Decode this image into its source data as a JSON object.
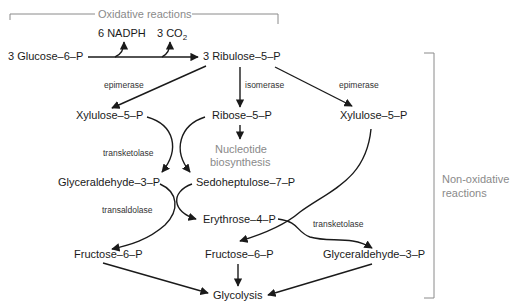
{
  "sections": {
    "oxidative": "Oxidative reactions",
    "non_oxidative_line1": "Non-oxidative",
    "non_oxidative_line2": "reactions"
  },
  "nodes": {
    "glucose6p": "3 Glucose–6–P",
    "nadph": "6 NADPH",
    "co2": "3 CO",
    "co2_sub": "2",
    "ribulose5p": "3 Ribulose–5–P",
    "xylulose5p_left": "Xylulose–5–P",
    "ribose5p": "Ribose–5–P",
    "xylulose5p_right": "Xylulose–5–P",
    "nucleotide_line1": "Nucleotide",
    "nucleotide_line2": "biosynthesis",
    "glyceraldehyde3p_left": "Glyceraldehyde–3–P",
    "sedoheptulose7p": "Sedoheptulose–7–P",
    "erythrose4p": "Erythrose–4–P",
    "fructose6p_left": "Fructose–6–P",
    "fructose6p_mid": "Fructose–6–P",
    "glyceraldehyde3p_right": "Glyceraldehyde–3–P",
    "glycolysis": "Glycolysis"
  },
  "enzymes": {
    "epimerase_left": "epimerase",
    "isomerase": "isomerase",
    "epimerase_right": "epimerase",
    "transketolase_1": "transketolase",
    "transaldolase": "transaldolase",
    "transketolase_2": "transketolase"
  },
  "colors": {
    "main_text": "#1a1a1a",
    "gray_text": "#8a8a8a"
  }
}
